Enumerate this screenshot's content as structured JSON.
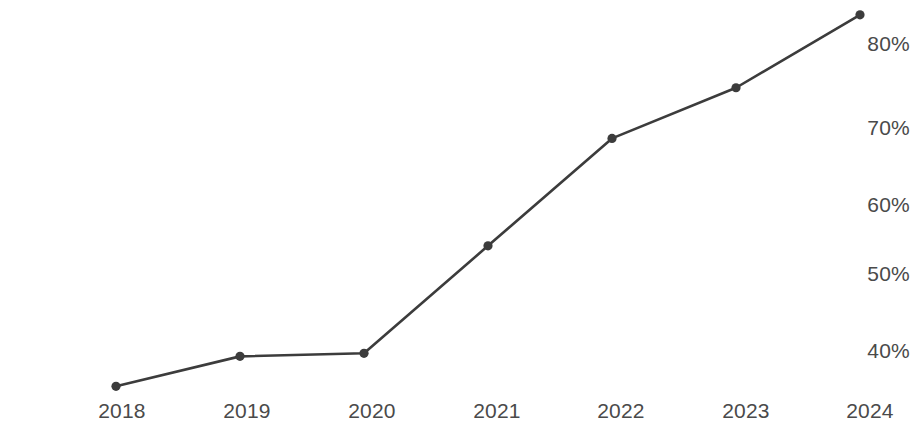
{
  "chart_data": {
    "type": "line",
    "title": "",
    "subtitle": "",
    "xlabel": "",
    "ylabel": "",
    "categories": [
      "2018",
      "2019",
      "2020",
      "2021",
      "2022",
      "2023",
      "2024"
    ],
    "x": [
      2018,
      2019,
      2020,
      2021,
      2022,
      2023,
      2024
    ],
    "values": [
      35.4,
      39.3,
      39.7,
      53.7,
      67.7,
      74.3,
      83.8
    ],
    "series": [
      {
        "name": "",
        "values": [
          35.4,
          39.3,
          39.7,
          53.7,
          67.7,
          74.3,
          83.8
        ]
      }
    ],
    "y_tick_labels": [
      "80%",
      "70%",
      "60%",
      "50%",
      "40%"
    ],
    "y_ticks": [
      80,
      70,
      60,
      50,
      40
    ],
    "x_tick_labels": [
      "2018",
      "2019",
      "2020",
      "2021",
      "2022",
      "2023",
      "2024"
    ],
    "ylim": [
      32,
      86
    ],
    "xlim": [
      2018,
      2024
    ],
    "grid": false,
    "legend": false,
    "legend_position": "none",
    "annotations": [],
    "line_color": "#3c3c3c",
    "marker_color": "#3c3c3c",
    "marker_style": "circle",
    "background_color": "#ffffff",
    "tick_label_color": "#4a4a4a"
  },
  "axes": {
    "y_axis_name": "y-axis",
    "x_axis_name": "x-axis"
  }
}
